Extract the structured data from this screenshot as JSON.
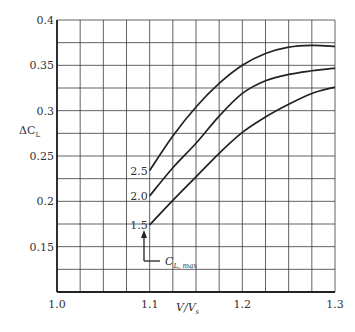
{
  "chart_data": {
    "type": "line",
    "title": "",
    "xlabel": "V/Vs",
    "xlabel_main": "V/V",
    "xlabel_sub": "s",
    "ylabel": "ΔCL",
    "ylabel_main": "ΔC",
    "ylabel_sub": "L",
    "xlim": [
      1.0,
      1.3
    ],
    "ylim": [
      0.1,
      0.4
    ],
    "xticks": [
      1.0,
      1.1,
      1.2,
      1.3
    ],
    "xtick_labels": [
      "1.0",
      "1.1",
      "1.2",
      "1.3"
    ],
    "yticks": [
      0.15,
      0.2,
      0.25,
      0.3,
      0.35,
      0.4
    ],
    "ytick_labels": [
      "0.15",
      "0.2",
      "0.25",
      "0.3",
      "0.35",
      "0.4"
    ],
    "grid": true,
    "grid_x_step": 0.025,
    "grid_y_step": 0.025,
    "legend": "none; curves labeled inline at left end",
    "series": [
      {
        "name": "CL,max = 2.5",
        "label": "2.5",
        "x": [
          1.1,
          1.125,
          1.15,
          1.175,
          1.2,
          1.225,
          1.25,
          1.275,
          1.3
        ],
        "values": [
          0.234,
          0.272,
          0.304,
          0.33,
          0.35,
          0.363,
          0.37,
          0.372,
          0.371
        ]
      },
      {
        "name": "CL,max = 2.0",
        "label": "2.0",
        "x": [
          1.1,
          1.125,
          1.15,
          1.175,
          1.2,
          1.225,
          1.25,
          1.275,
          1.3
        ],
        "values": [
          0.206,
          0.237,
          0.264,
          0.294,
          0.319,
          0.333,
          0.34,
          0.344,
          0.347
        ]
      },
      {
        "name": "CL,max = 1.5",
        "label": "1.5",
        "x": [
          1.1,
          1.125,
          1.15,
          1.175,
          1.2,
          1.225,
          1.25,
          1.275,
          1.3
        ],
        "values": [
          0.174,
          0.201,
          0.227,
          0.253,
          0.276,
          0.293,
          0.307,
          0.319,
          0.326
        ]
      }
    ],
    "annotations": [
      {
        "text": "CL,max",
        "main": "C",
        "sub": "L, max",
        "arrow_to": "curve labels at x=1.1"
      }
    ]
  }
}
